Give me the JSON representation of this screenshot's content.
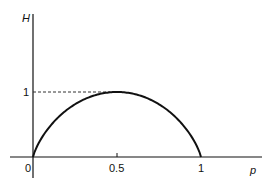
{
  "chart_data": {
    "type": "line",
    "title": "",
    "xlabel": "p",
    "ylabel": "H",
    "x_ticks": [
      "0",
      "0.5",
      "1"
    ],
    "y_ticks": [
      "1"
    ],
    "xlim": [
      0,
      1
    ],
    "ylim": [
      0,
      1
    ],
    "grid": false,
    "annotations": [
      "dashed reference line at H = 1 from y-axis to peak"
    ],
    "series": [
      {
        "name": "H(p)",
        "x": [
          0,
          0.05,
          0.1,
          0.2,
          0.3,
          0.4,
          0.5,
          0.6,
          0.7,
          0.8,
          0.9,
          0.95,
          1
        ],
        "values": [
          0,
          0.286,
          0.469,
          0.722,
          0.881,
          0.971,
          1,
          0.971,
          0.881,
          0.722,
          0.469,
          0.286,
          0
        ]
      }
    ]
  },
  "labels": {
    "y_axis": "H",
    "x_axis": "p",
    "y_tick_1": "1",
    "x_tick_0": "0",
    "x_tick_half": "0.5",
    "x_tick_1": "1"
  }
}
